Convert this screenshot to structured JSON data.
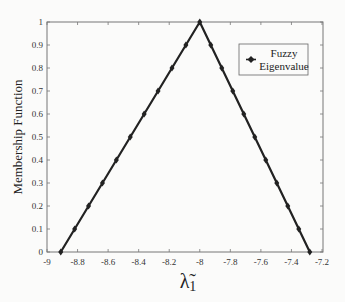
{
  "chart_data": {
    "type": "line",
    "title": "",
    "xlabel": "λ̃1",
    "ylabel": "Membership Function",
    "xlim": [
      -9,
      -7.2
    ],
    "ylim": [
      0,
      1
    ],
    "xticks": [
      -9,
      -8.8,
      -8.6,
      -8.4,
      -8.2,
      -8,
      -7.8,
      -7.6,
      -7.4,
      -7.2
    ],
    "xtick_labels": [
      "-9",
      "-8.8",
      "-8.6",
      "-8.4",
      "-8.2",
      "-8",
      "-7.8",
      "-7.6",
      "-7.4",
      "-7.2"
    ],
    "yticks": [
      0,
      0.1,
      0.2,
      0.3,
      0.4,
      0.5,
      0.6,
      0.7,
      0.8,
      0.9,
      1
    ],
    "ytick_labels": [
      "0",
      "0.1",
      "0.2",
      "0.3",
      "0.4",
      "0.5",
      "0.6",
      "0.7",
      "0.8",
      "0.9",
      "1"
    ],
    "grid": false,
    "legend_position": "upper right",
    "series": [
      {
        "name": "Fuzzy Eigenvalue",
        "color": "#222222",
        "marker": "diamond",
        "x": [
          -8.91,
          -8.819,
          -8.728,
          -8.637,
          -8.546,
          -8.455,
          -8.364,
          -8.273,
          -8.182,
          -8.091,
          -8.0,
          -7.928,
          -7.856,
          -7.784,
          -7.712,
          -7.64,
          -7.568,
          -7.496,
          -7.424,
          -7.352,
          -7.28
        ],
        "y": [
          0,
          0.1,
          0.2,
          0.3,
          0.4,
          0.5,
          0.6,
          0.7,
          0.8,
          0.9,
          1.0,
          0.9,
          0.8,
          0.7,
          0.6,
          0.5,
          0.4,
          0.3,
          0.2,
          0.1,
          0
        ]
      }
    ]
  },
  "legend": {
    "line1": "Fuzzy",
    "line2": "Eigenvalue"
  },
  "axes": {
    "ylabel": "Membership Function",
    "xlabel_main": "λ̃",
    "xlabel_sub": "1"
  }
}
